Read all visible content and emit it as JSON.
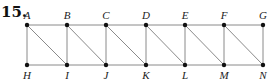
{
  "problem_number": "15.",
  "style": {
    "edge_color": "#8a8a8a",
    "node_color": "#111111"
  },
  "nodes": [
    {
      "id": "A",
      "x": 27,
      "y": 25,
      "label_pos": "above"
    },
    {
      "id": "B",
      "x": 67,
      "y": 25,
      "label_pos": "above"
    },
    {
      "id": "C",
      "x": 106,
      "y": 25,
      "label_pos": "above"
    },
    {
      "id": "D",
      "x": 146,
      "y": 25,
      "label_pos": "above"
    },
    {
      "id": "E",
      "x": 185,
      "y": 25,
      "label_pos": "above"
    },
    {
      "id": "F",
      "x": 224,
      "y": 25,
      "label_pos": "above"
    },
    {
      "id": "G",
      "x": 263,
      "y": 25,
      "label_pos": "above"
    },
    {
      "id": "H",
      "x": 27,
      "y": 65,
      "label_pos": "below"
    },
    {
      "id": "I",
      "x": 67,
      "y": 65,
      "label_pos": "below"
    },
    {
      "id": "J",
      "x": 106,
      "y": 65,
      "label_pos": "below"
    },
    {
      "id": "K",
      "x": 146,
      "y": 65,
      "label_pos": "below"
    },
    {
      "id": "L",
      "x": 185,
      "y": 65,
      "label_pos": "below"
    },
    {
      "id": "M",
      "x": 224,
      "y": 65,
      "label_pos": "below"
    },
    {
      "id": "N",
      "x": 263,
      "y": 65,
      "label_pos": "below"
    }
  ],
  "edges": [
    [
      "A",
      "B"
    ],
    [
      "B",
      "C"
    ],
    [
      "C",
      "D"
    ],
    [
      "D",
      "E"
    ],
    [
      "E",
      "F"
    ],
    [
      "F",
      "G"
    ],
    [
      "H",
      "I"
    ],
    [
      "I",
      "J"
    ],
    [
      "J",
      "K"
    ],
    [
      "K",
      "L"
    ],
    [
      "L",
      "M"
    ],
    [
      "M",
      "N"
    ],
    [
      "A",
      "H"
    ],
    [
      "B",
      "I"
    ],
    [
      "C",
      "J"
    ],
    [
      "D",
      "K"
    ],
    [
      "E",
      "L"
    ],
    [
      "F",
      "M"
    ],
    [
      "G",
      "N"
    ],
    [
      "A",
      "I"
    ],
    [
      "B",
      "J"
    ],
    [
      "C",
      "K"
    ],
    [
      "D",
      "L"
    ],
    [
      "E",
      "M"
    ],
    [
      "F",
      "N"
    ]
  ]
}
